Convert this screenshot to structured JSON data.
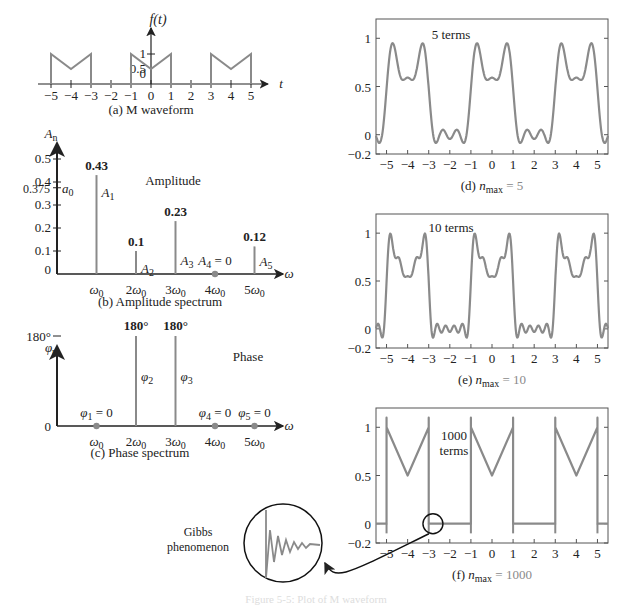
{
  "colors": {
    "curve": "#8a8a8a",
    "axis": "#222222",
    "annotation": "#8a8a8a",
    "frame": "#555555"
  },
  "figure_caption": "Figure 5-5: Plot of M waveform",
  "chart_data": [
    {
      "id": "a",
      "type": "line",
      "title": "(a) M waveform",
      "ylabel": "f(t)",
      "xlabel": "t",
      "x_ticks": [
        -5,
        -4,
        -3,
        -2,
        -1,
        0,
        1,
        2,
        3,
        4,
        5
      ],
      "y_ticks": [
        {
          "v": 0,
          "label": "0"
        },
        {
          "v": 0.5,
          "label": "0.5"
        },
        {
          "v": 1,
          "label": "1"
        }
      ],
      "period": 4,
      "series": [
        {
          "name": "f(t)",
          "points": [
            [
              -5,
              0
            ],
            [
              -5,
              1
            ],
            [
              -4,
              0.5
            ],
            [
              -3,
              1
            ],
            [
              -3,
              0
            ],
            [
              -1,
              0
            ],
            [
              -1,
              1
            ],
            [
              0,
              0.5
            ],
            [
              1,
              1
            ],
            [
              1,
              0
            ],
            [
              3,
              0
            ],
            [
              3,
              1
            ],
            [
              4,
              0.5
            ],
            [
              5,
              1
            ],
            [
              5,
              0
            ]
          ]
        }
      ]
    },
    {
      "id": "b",
      "type": "bar",
      "title": "(b) Amplitude spectrum",
      "ylabel": "A_n",
      "xlabel": "ω",
      "annotation": "Amplitude",
      "y_ticks": [
        0,
        0.1,
        0.2,
        0.3,
        0.4,
        0.5
      ],
      "extra_tick": {
        "v": 0.375,
        "label": "0.375",
        "name": "a0"
      },
      "categories": [
        "ω0",
        "2ω0",
        "3ω0",
        "4ω0",
        "5ω0"
      ],
      "values": [
        0.43,
        0.1,
        0.23,
        0,
        0.12
      ],
      "value_labels": [
        "0.43",
        "0.1",
        "0.23",
        "",
        "0.12"
      ],
      "names": [
        "A1",
        "A2",
        "A3",
        "A4 = 0",
        "A5"
      ],
      "ylim": [
        0,
        0.55
      ]
    },
    {
      "id": "c",
      "type": "bar",
      "title": "(c) Phase spectrum",
      "ylabel": "φ_n",
      "xlabel": "ω",
      "annotation": "Phase",
      "y_ticks": [
        {
          "v": 0,
          "label": "0"
        },
        {
          "v": 180,
          "label": "180°"
        }
      ],
      "categories": [
        "ω0",
        "2ω0",
        "3ω0",
        "4ω0",
        "5ω0"
      ],
      "values": [
        0,
        180,
        180,
        0,
        0
      ],
      "value_labels": [
        "",
        "180°",
        "180°",
        "",
        ""
      ],
      "names": [
        "φ1 = 0",
        "φ2",
        "φ3",
        "φ4 = 0",
        "φ5 = 0"
      ]
    },
    {
      "id": "d",
      "type": "line",
      "title": "(d) n_max = 5",
      "annotation": "5 terms",
      "n_max": 5,
      "xlim": [
        -5.5,
        5.5
      ],
      "ylim": [
        -0.2,
        1.2
      ],
      "x_ticks": [
        -5,
        -4,
        -3,
        -2,
        -1,
        0,
        1,
        2,
        3,
        4,
        5
      ],
      "y_ticks": [
        {
          "v": -0.2,
          "label": "−0.2"
        },
        {
          "v": 0,
          "label": "0"
        },
        {
          "v": 0.5,
          "label": "0.5"
        },
        {
          "v": 1,
          "label": "1"
        }
      ]
    },
    {
      "id": "e",
      "type": "line",
      "title": "(e) n_max = 10",
      "annotation": "10 terms",
      "n_max": 10,
      "xlim": [
        -5.5,
        5.5
      ],
      "ylim": [
        -0.2,
        1.2
      ],
      "x_ticks": [
        -5,
        -4,
        -3,
        -2,
        -1,
        0,
        1,
        2,
        3,
        4,
        5
      ],
      "y_ticks": [
        {
          "v": -0.2,
          "label": "−0.2"
        },
        {
          "v": 0,
          "label": "0"
        },
        {
          "v": 0.5,
          "label": "0.5"
        },
        {
          "v": 1,
          "label": "1"
        }
      ]
    },
    {
      "id": "f",
      "type": "line",
      "title": "(f) n_max = 1000",
      "annotation": "1000 terms",
      "n_max": 1000,
      "xlim": [
        -5.5,
        5.5
      ],
      "ylim": [
        -0.2,
        1.2
      ],
      "x_ticks": [
        -5,
        -4,
        -3,
        -2,
        -1,
        0,
        1,
        2,
        3,
        4,
        5
      ],
      "y_ticks": [
        {
          "v": -0.2,
          "label": "−0.2"
        },
        {
          "v": 0,
          "label": "0"
        },
        {
          "v": 0.5,
          "label": "0.5"
        },
        {
          "v": 1,
          "label": "1"
        }
      ],
      "inset_label": "Gibbs phenomenon"
    }
  ]
}
